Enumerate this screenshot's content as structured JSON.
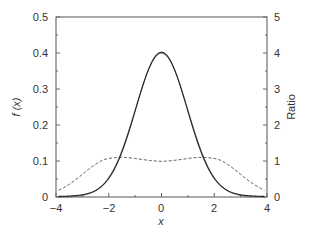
{
  "chart_data": {
    "type": "line",
    "title": "",
    "xlabel": "x",
    "ylabel": "f (x)",
    "y2label": "Ratio",
    "xlim": [
      -4,
      4
    ],
    "ylim": [
      0,
      0.5
    ],
    "y2lim": [
      0,
      5
    ],
    "grid": false,
    "legend": null,
    "x_ticks": [
      "−4",
      "−2",
      "0",
      "2",
      "4"
    ],
    "y_ticks": [
      "0",
      "0.1",
      "0.2",
      "0.3",
      "0.4",
      "0.5"
    ],
    "y2_ticks": [
      "0",
      "1",
      "2",
      "3",
      "4",
      "5"
    ],
    "x": [
      -4,
      -3.5,
      -3,
      -2.5,
      -2,
      -1.5,
      -1,
      -0.5,
      0,
      0.5,
      1,
      1.5,
      2,
      2.5,
      3,
      3.5,
      4
    ],
    "series": [
      {
        "name": "density 1 (solid, thin)",
        "axis": "left",
        "style": "solid",
        "values": [
          0.0001,
          0.0009,
          0.0044,
          0.0175,
          0.054,
          0.1295,
          0.242,
          0.352,
          0.399,
          0.352,
          0.242,
          0.1295,
          0.054,
          0.0175,
          0.0044,
          0.0009,
          0.0001
        ]
      },
      {
        "name": "density 2 (solid)",
        "axis": "left",
        "style": "solid",
        "values": [
          0.003,
          0.006,
          0.012,
          0.026,
          0.06,
          0.14,
          0.25,
          0.36,
          0.408,
          0.36,
          0.25,
          0.14,
          0.06,
          0.026,
          0.012,
          0.006,
          0.003
        ]
      },
      {
        "name": "Ratio (dashed)",
        "axis": "right",
        "style": "dashed",
        "values": [
          0.1,
          0.3,
          0.5,
          0.8,
          1.05,
          1.1,
          1.05,
          1.0,
          0.98,
          1.0,
          1.05,
          1.1,
          1.05,
          0.8,
          0.5,
          0.3,
          0.1
        ]
      }
    ]
  },
  "labels": {
    "xlabel": "x",
    "ylabel": "f (x)",
    "y2label": "Ratio",
    "x_ticks": [
      "−4",
      "−2",
      "0",
      "2",
      "4"
    ],
    "y_ticks": [
      "0",
      "0.1",
      "0.2",
      "0.3",
      "0.4",
      "0.5"
    ],
    "y2_ticks": [
      "0",
      "1",
      "2",
      "3",
      "4",
      "5"
    ]
  }
}
